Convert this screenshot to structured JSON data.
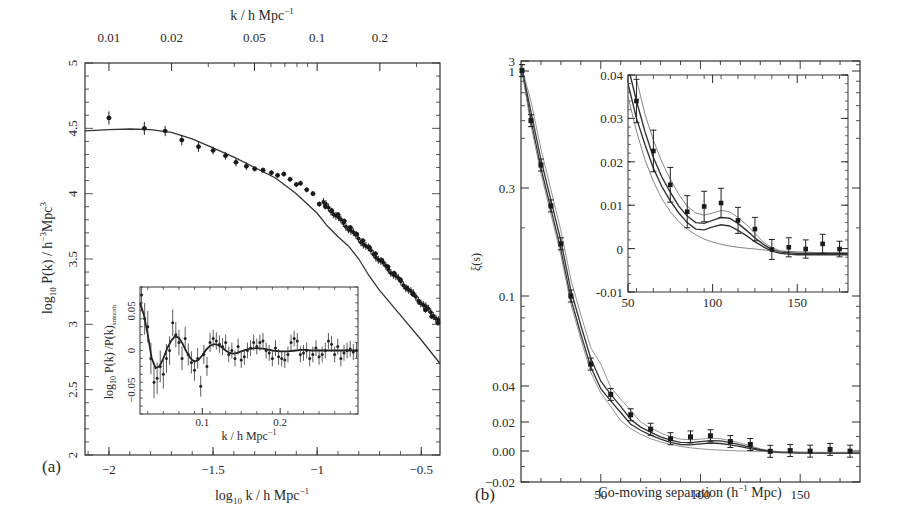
{
  "chart_data": [
    {
      "panel": "(a)",
      "type": "scatter",
      "title": "",
      "xlabel": "log10 k / h Mpc^-1",
      "ylabel": "log10 P(k) / h^-3 Mpc^3",
      "top_xlabel": "k / h Mpc^-1",
      "xlim": [
        -2.115,
        -0.41
      ],
      "ylim": [
        2,
        5
      ],
      "xticks": [
        -2,
        -1.5,
        -1,
        -0.5
      ],
      "xtick_labels": [
        "−2",
        "−1.5",
        "−1",
        "−0.5"
      ],
      "yticks": [
        2,
        2.5,
        3,
        3.5,
        4,
        4.5,
        5
      ],
      "ytick_labels": [
        "2",
        "2.5",
        "3",
        "3.5",
        "4",
        "4.5",
        "5"
      ],
      "top_ticks": [
        0.01,
        0.02,
        0.05,
        0.1,
        0.2
      ],
      "top_tick_labels": [
        "0.01",
        "0.02",
        "0.05",
        "0.1",
        "0.2"
      ],
      "grid": false,
      "series": [
        {
          "name": "data points",
          "style": "points-with-errorbars",
          "x": [
            -2.0,
            -1.83,
            -1.73,
            -1.65,
            -1.57,
            -1.5,
            -1.44,
            -1.39,
            -1.34,
            -1.3,
            -1.26,
            -1.22,
            -1.19,
            -1.16,
            -1.13,
            -1.1,
            -1.08,
            -1.05,
            -1.02,
            -0.99,
            -0.96,
            -0.93,
            -0.9,
            -0.87,
            -0.84,
            -0.81,
            -0.78,
            -0.75,
            -0.72,
            -0.69,
            -0.66,
            -0.63,
            -0.6,
            -0.57,
            -0.54,
            -0.51,
            -0.48,
            -0.45,
            -0.42
          ],
          "y": [
            4.58,
            4.5,
            4.48,
            4.41,
            4.36,
            4.33,
            4.29,
            4.24,
            4.21,
            4.19,
            4.18,
            4.16,
            4.14,
            4.15,
            4.11,
            4.07,
            4.08,
            4.03,
            4.0,
            3.92,
            3.9,
            3.87,
            3.84,
            3.79,
            3.74,
            3.69,
            3.64,
            3.59,
            3.54,
            3.49,
            3.44,
            3.39,
            3.34,
            3.28,
            3.23,
            3.17,
            3.11,
            3.06,
            3.01
          ],
          "yerr": [
            0.05,
            0.05,
            0.04,
            0.04,
            0.04,
            0.03,
            0.03,
            0.03,
            0.03,
            0.02,
            0.02,
            0.02,
            0.02,
            0.02,
            0.02,
            0.02,
            0.02,
            0.02,
            0.02,
            0.02,
            0.02,
            0.02,
            0.02,
            0.02,
            0.02,
            0.02,
            0.02,
            0.02,
            0.02,
            0.02,
            0.02,
            0.02,
            0.02,
            0.02,
            0.02,
            0.02,
            0.02,
            0.02,
            0.02
          ]
        },
        {
          "name": "linear model",
          "style": "line",
          "x": [
            -2.115,
            -2.0,
            -1.9,
            -1.8,
            -1.7,
            -1.6,
            -1.5,
            -1.4,
            -1.3,
            -1.2,
            -1.1,
            -1.0,
            -0.95,
            -0.9,
            -0.85,
            -0.8,
            -0.75,
            -0.7,
            -0.6,
            -0.5,
            -0.41
          ],
          "y": [
            4.48,
            4.49,
            4.495,
            4.49,
            4.47,
            4.42,
            4.35,
            4.28,
            4.2,
            4.12,
            4.0,
            3.85,
            3.75,
            3.67,
            3.6,
            3.5,
            3.37,
            3.26,
            3.07,
            2.88,
            2.7
          ]
        }
      ],
      "inset": {
        "type": "scatter",
        "xlabel": "k / h Mpc^-1",
        "ylabel": "log10 P(k)/P(k)smooth",
        "xlim": [
          0.02,
          0.3
        ],
        "ylim": [
          -0.08,
          0.08
        ],
        "xticks": [
          0.1,
          0.2
        ],
        "xtick_labels": [
          "0.1",
          "0.2"
        ],
        "yticks": [
          -0.05,
          0,
          0.05
        ],
        "ytick_labels": [
          "−0.05",
          "0",
          "0.05"
        ],
        "series": [
          {
            "name": "data points",
            "style": "points-with-errorbars",
            "x": [
              0.022,
              0.026,
              0.03,
              0.034,
              0.038,
              0.042,
              0.046,
              0.05,
              0.054,
              0.058,
              0.062,
              0.066,
              0.07,
              0.074,
              0.078,
              0.082,
              0.086,
              0.09,
              0.094,
              0.098,
              0.102,
              0.106,
              0.11,
              0.114,
              0.118,
              0.122,
              0.126,
              0.13,
              0.134,
              0.138,
              0.142,
              0.146,
              0.15,
              0.154,
              0.158,
              0.162,
              0.166,
              0.17,
              0.174,
              0.178,
              0.182,
              0.186,
              0.19,
              0.194,
              0.198,
              0.202,
              0.206,
              0.21,
              0.214,
              0.218,
              0.222,
              0.226,
              0.23,
              0.234,
              0.238,
              0.242,
              0.246,
              0.25,
              0.254,
              0.258,
              0.262,
              0.266,
              0.27,
              0.274,
              0.278,
              0.282,
              0.286,
              0.29,
              0.294,
              0.298
            ],
            "y": [
              0.07,
              0.04,
              0.03,
              -0.01,
              -0.04,
              -0.035,
              -0.02,
              -0.03,
              -0.01,
              0.0,
              0.035,
              0.02,
              0.01,
              -0.01,
              0.015,
              -0.005,
              -0.015,
              -0.025,
              -0.01,
              -0.045,
              -0.005,
              -0.02,
              0.01,
              0.015,
              0.012,
              0.008,
              0.005,
              0.01,
              -0.005,
              0.0,
              -0.01,
              0.005,
              -0.012,
              -0.008,
              0.0,
              0.003,
              0.01,
              0.005,
              0.01,
              0.012,
              0.0,
              -0.003,
              -0.01,
              0.003,
              -0.008,
              -0.01,
              -0.012,
              -0.005,
              0.01,
              0.015,
              0.012,
              -0.005,
              -0.003,
              0.0,
              -0.01,
              -0.005,
              0.003,
              -0.008,
              -0.005,
              0.0,
              0.012,
              0.008,
              -0.005,
              0.005,
              -0.01,
              -0.003,
              0.0,
              0.002,
              -0.002,
              0.0
            ],
            "yerr": [
              0.02,
              0.02,
              0.02,
              0.02,
              0.02,
              0.02,
              0.02,
              0.018,
              0.018,
              0.018,
              0.017,
              0.016,
              0.016,
              0.015,
              0.015,
              0.014,
              0.014,
              0.013,
              0.013,
              0.013,
              0.012,
              0.012,
              0.012,
              0.011,
              0.011,
              0.011,
              0.011,
              0.01,
              0.01,
              0.01,
              0.01,
              0.01,
              0.01,
              0.01,
              0.01,
              0.01,
              0.01,
              0.01,
              0.01,
              0.01,
              0.01,
              0.01,
              0.01,
              0.01,
              0.01,
              0.01,
              0.01,
              0.01,
              0.01,
              0.01,
              0.01,
              0.01,
              0.01,
              0.01,
              0.01,
              0.01,
              0.01,
              0.01,
              0.01,
              0.01,
              0.01,
              0.01,
              0.01,
              0.01,
              0.01,
              0.01,
              0.01,
              0.01,
              0.01,
              0.01
            ]
          },
          {
            "name": "BAO model",
            "style": "line",
            "x": [
              0.02,
              0.025,
              0.03,
              0.035,
              0.04,
              0.045,
              0.05,
              0.055,
              0.06,
              0.065,
              0.07,
              0.075,
              0.08,
              0.085,
              0.09,
              0.095,
              0.1,
              0.105,
              0.11,
              0.115,
              0.12,
              0.125,
              0.13,
              0.135,
              0.14,
              0.145,
              0.15,
              0.16,
              0.17,
              0.18,
              0.19,
              0.2,
              0.21,
              0.22,
              0.23,
              0.24,
              0.25,
              0.26,
              0.27,
              0.28,
              0.29,
              0.3
            ],
            "y": [
              0.06,
              0.045,
              0.02,
              -0.01,
              -0.022,
              -0.02,
              -0.01,
              0.003,
              0.012,
              0.018,
              0.016,
              0.008,
              -0.002,
              -0.01,
              -0.014,
              -0.012,
              -0.006,
              0.001,
              0.006,
              0.008,
              0.007,
              0.004,
              0.0,
              -0.003,
              -0.004,
              -0.003,
              -0.001,
              0.002,
              0.003,
              0.002,
              0.0,
              -0.001,
              -0.001,
              0.0,
              0.001,
              0.0,
              0.0,
              0.0,
              0.0,
              0.0,
              0.0,
              0.0
            ]
          }
        ]
      }
    },
    {
      "panel": "(b)",
      "type": "line",
      "title": "",
      "xlabel": "Co-moving separation (h^-1 Mpc)",
      "ylabel": "ξ(s)",
      "xlim": [
        10,
        180
      ],
      "ylim_labels": [
        "−0.02",
        "0.00",
        "0.02",
        "0.04",
        "0.1",
        "0.3",
        "1",
        "3"
      ],
      "yscale": "mixed (log above 0.04, linear below)",
      "xticks": [
        50,
        100,
        150
      ],
      "xtick_labels": [
        "50",
        "100",
        "150"
      ],
      "grid": false,
      "series": [
        {
          "name": "data points",
          "style": "points-with-errorbars",
          "x": [
            10.5,
            15,
            20,
            25,
            30,
            35,
            45,
            55,
            65,
            75,
            85,
            95,
            105,
            115,
            125,
            135,
            145,
            155,
            165,
            175
          ],
          "y": [
            1.05,
            0.6,
            0.38,
            0.25,
            0.17,
            0.1,
            0.05,
            0.034,
            0.023,
            0.015,
            0.0085,
            0.0097,
            0.0105,
            0.0065,
            0.0045,
            -0.0002,
            0.0003,
            -0.0001,
            0.0011,
            -0.0001
          ]
        },
        {
          "name": "model 1 (highest)",
          "style": "line-thin"
        },
        {
          "name": "model 2",
          "style": "line"
        },
        {
          "name": "model 3",
          "style": "line"
        },
        {
          "name": "model 4 (no baryon peak)",
          "style": "line-thin"
        }
      ],
      "inset": {
        "xlim": [
          50,
          180
        ],
        "ylim": [
          -0.01,
          0.04
        ],
        "xticks": [
          50,
          100,
          150
        ],
        "xtick_labels": [
          "50",
          "100",
          "150"
        ],
        "yticks": [
          -0.01,
          0,
          0.01,
          0.02,
          0.03,
          0.04
        ],
        "ytick_labels": [
          "-0.01",
          "0",
          "0.01",
          "0.02",
          "0.03",
          "0.04"
        ],
        "series": [
          {
            "name": "data points",
            "style": "points-with-errorbars",
            "x": [
              55,
              65,
              75,
              85,
              95,
              105,
              115,
              125,
              135,
              145,
              155,
              165,
              175
            ],
            "y": [
              0.034,
              0.0225,
              0.0147,
              0.0085,
              0.0097,
              0.0105,
              0.0065,
              0.0045,
              -0.0002,
              0.0003,
              -0.0001,
              0.0011,
              -0.0001
            ],
            "yerr": [
              0.005,
              0.0048,
              0.004,
              0.0037,
              0.0035,
              0.0034,
              0.003,
              0.0027,
              0.0023,
              0.0022,
              0.0021,
              0.0022,
              0.0018
            ]
          },
          {
            "name": "model 1",
            "x": [
              50,
              55,
              60,
              65,
              70,
              75,
              80,
              85,
              90,
              95,
              100,
              105,
              110,
              115,
              120,
              125,
              130,
              135,
              140,
              150,
              160,
              170,
              180
            ],
            "y": [
              0.05,
              0.039,
              0.031,
              0.025,
              0.02,
              0.016,
              0.0125,
              0.0098,
              0.0082,
              0.0077,
              0.0082,
              0.0088,
              0.0085,
              0.0072,
              0.0055,
              0.0035,
              0.0015,
              0.0002,
              -0.0005,
              -0.0008,
              -0.0009,
              -0.0009,
              -0.0009
            ]
          },
          {
            "name": "model 2",
            "x": [
              50,
              55,
              60,
              65,
              70,
              75,
              80,
              85,
              90,
              95,
              100,
              105,
              110,
              115,
              120,
              125,
              130,
              135,
              140,
              150,
              160,
              170,
              180
            ],
            "y": [
              0.042,
              0.034,
              0.027,
              0.021,
              0.0165,
              0.013,
              0.0098,
              0.0075,
              0.006,
              0.0058,
              0.0065,
              0.0072,
              0.007,
              0.0058,
              0.0042,
              0.0025,
              0.001,
              -0.0002,
              -0.0008,
              -0.0011,
              -0.0012,
              -0.0012,
              -0.0012
            ]
          },
          {
            "name": "model 3",
            "x": [
              50,
              55,
              60,
              65,
              70,
              75,
              80,
              85,
              90,
              95,
              100,
              105,
              110,
              115,
              120,
              125,
              130,
              135,
              140,
              150,
              160,
              170,
              180
            ],
            "y": [
              0.038,
              0.03,
              0.024,
              0.0185,
              0.0143,
              0.011,
              0.0082,
              0.006,
              0.0045,
              0.0043,
              0.005,
              0.0055,
              0.0052,
              0.0042,
              0.003,
              0.0016,
              0.0004,
              -0.0006,
              -0.0011,
              -0.0014,
              -0.0014,
              -0.0014,
              -0.0014
            ]
          },
          {
            "name": "model 4 (no peak)",
            "x": [
              50,
              55,
              60,
              65,
              70,
              75,
              80,
              85,
              90,
              95,
              100,
              105,
              110,
              115,
              120,
              125,
              130,
              135,
              140,
              150,
              160,
              170,
              180
            ],
            "y": [
              0.035,
              0.027,
              0.0205,
              0.0155,
              0.0115,
              0.0085,
              0.0062,
              0.0045,
              0.0032,
              0.0022,
              0.0015,
              0.001,
              0.0006,
              0.0003,
              0.0001,
              -0.0001,
              -0.0003,
              -0.0005,
              -0.0006,
              -0.0008,
              -0.0009,
              -0.0009,
              -0.0009
            ]
          }
        ]
      }
    }
  ],
  "labels": {
    "panel_a": "(a)",
    "panel_b": "(b)",
    "a_top_axis_title": "k / h Mpc",
    "a_top_axis_sup": "−1",
    "a_bottom_axis_title_pre": "log",
    "a_bottom_axis_title_sub": "10",
    "a_bottom_axis_title_post": " k / h Mpc",
    "a_bottom_axis_title_sup": "−1",
    "a_y_axis_title_pre": "log",
    "a_y_axis_title_sub": "10",
    "a_y_axis_title_mid": " P(k) / h",
    "a_y_axis_title_sup1": "−3",
    "a_y_axis_title_mid2": "Mpc",
    "a_y_axis_title_sup2": "3",
    "a_inset_xlabel": "k / h Mpc",
    "a_inset_xlabel_sup": "−1",
    "a_inset_ylabel_pre": "log",
    "a_inset_ylabel_sub": "10",
    "a_inset_ylabel_mid": " P(k) /P(k)",
    "a_inset_ylabel_sub2": "smooth",
    "b_x_axis_title_pre": "Co-moving separation (h",
    "b_x_axis_title_sup": "−1",
    "b_x_axis_title_post": " Mpc)",
    "b_y_axis_title": "ξ(s)"
  }
}
